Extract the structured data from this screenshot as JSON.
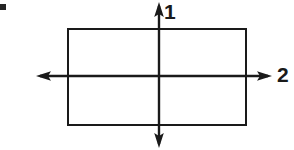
{
  "figure": {
    "kind": "geometry-diagram",
    "background_color": "#ffffff",
    "stroke_color": "#1a1a1a",
    "canvas": {
      "width": 294,
      "height": 150
    }
  },
  "labels": {
    "vertical_axis": "1",
    "horizontal_axis": "2"
  },
  "geometry": {
    "rectangle": {
      "name": "rectangle",
      "x": 67,
      "y": 28,
      "width": 179,
      "height": 97,
      "stroke_width": 2,
      "fill": "none"
    },
    "origin": {
      "x": 159,
      "y": 76
    },
    "vertical_axis": {
      "name": "vertical-axis",
      "x": 159,
      "y_top": 3,
      "y_bottom": 147,
      "arrowheads": [
        "up",
        "down"
      ]
    },
    "horizontal_axis": {
      "name": "horizontal-axis",
      "y": 76,
      "x_left": 37,
      "x_right": 271,
      "arrowheads": [
        "left",
        "right"
      ]
    }
  },
  "artifacts": {
    "corner_mark": {
      "name": "scan-artifact-mark",
      "x": 0,
      "y": 4,
      "width": 6,
      "height": 6,
      "color": "#242424"
    }
  }
}
